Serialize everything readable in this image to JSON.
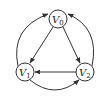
{
  "diagram": {
    "type": "directed-graph",
    "nodes": [
      {
        "id": "V0",
        "label": "V",
        "sub": "0",
        "x": 58,
        "y": 19
      },
      {
        "id": "V1",
        "label": "V",
        "sub": "1",
        "x": 25,
        "y": 72
      },
      {
        "id": "V2",
        "label": "V",
        "sub": "2",
        "x": 85,
        "y": 72
      }
    ],
    "edges": [
      {
        "from": "V0",
        "to": "V1",
        "shape": "straight"
      },
      {
        "from": "V0",
        "to": "V2",
        "shape": "straight"
      },
      {
        "from": "V2",
        "to": "V1",
        "shape": "straight"
      },
      {
        "from": "V1",
        "to": "V2",
        "shape": "curve-bottom"
      },
      {
        "from": "V1",
        "to": "V0",
        "shape": "curve-left"
      },
      {
        "from": "V2",
        "to": "V0",
        "shape": "curve-right"
      }
    ],
    "colors": {
      "stroke": "#333333",
      "background": "#ffffff"
    }
  }
}
